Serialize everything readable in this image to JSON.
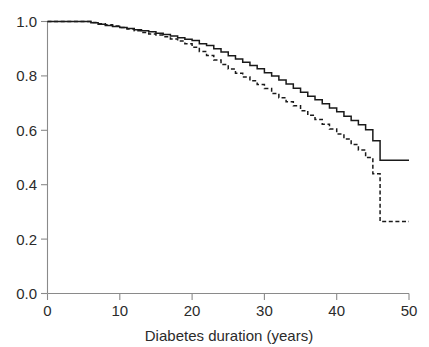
{
  "chart_data": {
    "type": "line",
    "title": "",
    "subtitle": "",
    "xlabel": "Diabetes duration (years)",
    "ylabel": "",
    "xlim": [
      0,
      50
    ],
    "ylim": [
      0.0,
      1.0
    ],
    "xticks": [
      0,
      10,
      20,
      30,
      40,
      50
    ],
    "xticklabels": [
      "0",
      "10",
      "20",
      "30",
      "40",
      "50"
    ],
    "yticks": [
      0.0,
      0.2,
      0.4,
      0.6,
      0.8,
      1.0
    ],
    "yticklabels": [
      "0.0",
      "0.2",
      "0.4",
      "0.6",
      "0.8",
      "1.0"
    ],
    "grid": false,
    "legend": null,
    "legend_position": "none",
    "annotations": [],
    "interpolation": "step-post",
    "series": [
      {
        "name": "solid-curve",
        "style": "solid",
        "color": "#1a1a1a",
        "x": [
          0,
          5.0,
          6.0,
          7.0,
          8.0,
          9.0,
          10.0,
          11.0,
          12.0,
          13.0,
          14.0,
          15.0,
          16.0,
          17.0,
          18.0,
          19.0,
          20.0,
          21.0,
          22.0,
          23.0,
          24.0,
          25.0,
          26.0,
          27.0,
          28.0,
          29.0,
          30.0,
          31.0,
          32.0,
          33.0,
          34.0,
          35.0,
          36.0,
          37.0,
          38.0,
          39.0,
          40.0,
          41.0,
          42.0,
          43.0,
          44.0,
          45.0,
          46.0,
          50.0
        ],
        "y": [
          1.0,
          1.0,
          0.995,
          0.99,
          0.985,
          0.982,
          0.978,
          0.974,
          0.97,
          0.966,
          0.962,
          0.957,
          0.952,
          0.947,
          0.94,
          0.935,
          0.93,
          0.918,
          0.912,
          0.9,
          0.888,
          0.874,
          0.862,
          0.85,
          0.838,
          0.826,
          0.812,
          0.8,
          0.785,
          0.77,
          0.755,
          0.74,
          0.725,
          0.712,
          0.698,
          0.682,
          0.668,
          0.652,
          0.636,
          0.62,
          0.602,
          0.562,
          0.49,
          0.49
        ]
      },
      {
        "name": "dashed-curve",
        "style": "dashed",
        "color": "#1a1a1a",
        "x": [
          0,
          5.0,
          6.0,
          7.0,
          8.0,
          9.0,
          10.0,
          11.0,
          12.0,
          13.0,
          14.0,
          15.0,
          16.0,
          17.0,
          18.0,
          19.0,
          20.0,
          21.0,
          22.0,
          23.0,
          24.0,
          25.0,
          26.0,
          27.0,
          28.0,
          29.0,
          30.0,
          31.0,
          32.0,
          33.0,
          34.0,
          35.0,
          36.0,
          37.0,
          38.0,
          39.0,
          40.0,
          41.0,
          42.0,
          43.0,
          44.0,
          45.0,
          46.0,
          50.0
        ],
        "y": [
          1.0,
          1.0,
          0.996,
          0.992,
          0.988,
          0.983,
          0.978,
          0.972,
          0.966,
          0.96,
          0.954,
          0.95,
          0.944,
          0.936,
          0.928,
          0.918,
          0.905,
          0.89,
          0.875,
          0.858,
          0.842,
          0.825,
          0.81,
          0.796,
          0.782,
          0.768,
          0.754,
          0.735,
          0.72,
          0.705,
          0.69,
          0.672,
          0.655,
          0.64,
          0.622,
          0.605,
          0.586,
          0.568,
          0.548,
          0.528,
          0.5,
          0.44,
          0.265,
          0.265
        ]
      }
    ]
  },
  "axes": {
    "x_axis_name": "diabetes-duration-axis",
    "y_axis_name": "survival-probability-axis"
  },
  "colors": {
    "axis": "#8a8a8a",
    "curve": "#1a1a1a",
    "text": "#2b2b2b",
    "background": "#ffffff"
  }
}
